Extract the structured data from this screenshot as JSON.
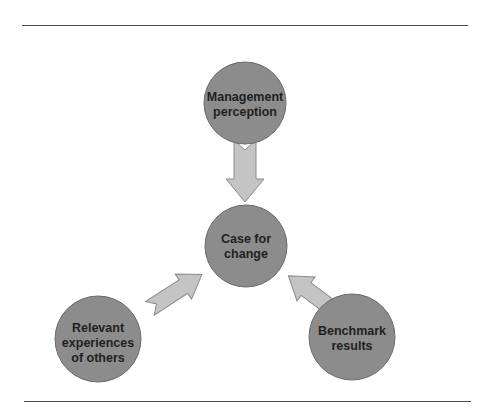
{
  "diagram": {
    "colors": {
      "circle_fill": "#8c8c8c",
      "circle_stroke": "#6a6a6a",
      "arrow_fill": "#c4c4c4",
      "arrow_stroke": "#8a8a8a",
      "rule": "#4a4a4a",
      "text": "#1f1f1f"
    },
    "nodes": {
      "top": {
        "lines": [
          "Management",
          "perception"
        ]
      },
      "center": {
        "lines": [
          "Case for",
          "change"
        ]
      },
      "bottom_left": {
        "lines": [
          "Relevant",
          "experiences",
          "of others"
        ]
      },
      "bottom_right": {
        "lines": [
          "Benchmark",
          "results"
        ]
      }
    },
    "arrows": [
      {
        "from": "top",
        "to": "center"
      },
      {
        "from": "bottom_left",
        "to": "center"
      },
      {
        "from": "bottom_right",
        "to": "center"
      }
    ]
  }
}
